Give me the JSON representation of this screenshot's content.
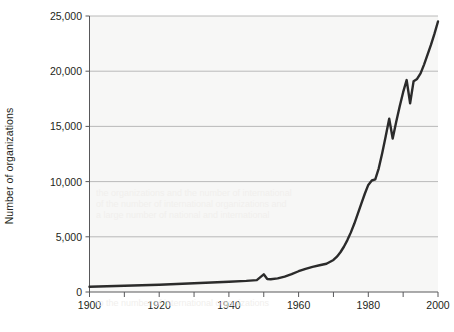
{
  "chart_data": {
    "type": "line",
    "title": "",
    "xlabel": "",
    "ylabel": "Number of organizations",
    "xlim": [
      1900,
      2000
    ],
    "ylim": [
      0,
      25000
    ],
    "grid": "horizontal",
    "legend": "none",
    "x_ticks": [
      1900,
      1920,
      1940,
      1960,
      1980,
      2000
    ],
    "x_tick_labels": [
      "1900",
      "1920",
      "1940",
      "1960",
      "1980",
      "2000"
    ],
    "x_minor_ticks": [
      1910,
      1930,
      1950,
      1970,
      1990
    ],
    "y_ticks": [
      0,
      5000,
      10000,
      15000,
      20000,
      25000
    ],
    "y_tick_labels": [
      "0",
      "5,000",
      "10,000",
      "15,000",
      "20,000",
      "25,000"
    ],
    "series": [
      {
        "name": "Number of organizations",
        "color": "#2b2b2b",
        "x": [
          1900,
          1905,
          1910,
          1915,
          1920,
          1925,
          1930,
          1935,
          1940,
          1945,
          1948,
          1950,
          1951,
          1952,
          1954,
          1956,
          1958,
          1960,
          1962,
          1964,
          1966,
          1968,
          1970,
          1971,
          1972,
          1973,
          1974,
          1975,
          1976,
          1977,
          1978,
          1979,
          1980,
          1981,
          1982,
          1983,
          1984,
          1985,
          1986,
          1987,
          1988,
          1989,
          1990,
          1991,
          1992,
          1993,
          1994,
          1995,
          1996,
          1997,
          1998,
          1999,
          2000
        ],
        "values": [
          480,
          520,
          560,
          610,
          660,
          720,
          790,
          860,
          930,
          1010,
          1080,
          1600,
          1180,
          1150,
          1230,
          1400,
          1620,
          1880,
          2100,
          2280,
          2420,
          2560,
          2900,
          3200,
          3600,
          4100,
          4700,
          5400,
          6200,
          7100,
          8000,
          8900,
          9700,
          10100,
          10200,
          11200,
          12600,
          14100,
          15700,
          13900,
          15400,
          16800,
          18100,
          19200,
          17100,
          19100,
          19300,
          19800,
          20600,
          21500,
          22400,
          23400,
          24500
        ]
      }
    ]
  },
  "ghost_text": {
    "lines": [
      "the organizations and the number of international",
      "of the number of international organizations and",
      "a large number of national and international",
      "to the number of international organizations"
    ]
  }
}
